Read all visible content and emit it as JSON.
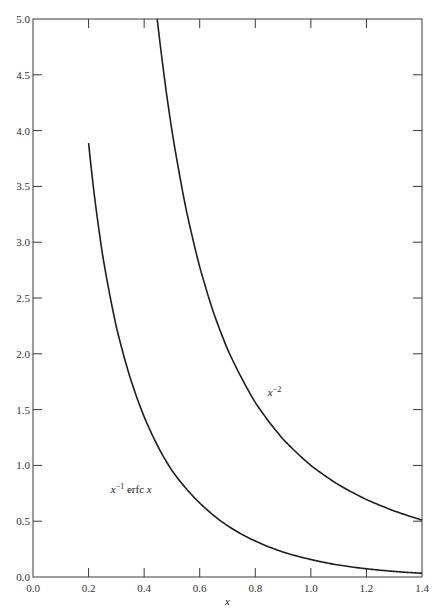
{
  "chart_data": {
    "type": "line",
    "title": "",
    "xlabel": "x",
    "ylabel": "",
    "xlim": [
      0.0,
      1.4
    ],
    "ylim": [
      0.0,
      5.0
    ],
    "grid": false,
    "legend": "none (curves labeled inline)",
    "x_ticks": [
      "0.0",
      "0.2",
      "0.4",
      "0.6",
      "0.8",
      "1.0",
      "1.2",
      "1.4"
    ],
    "y_ticks": [
      "0.0",
      "0.5",
      "1.0",
      "1.5",
      "2.0",
      "2.5",
      "3.0",
      "3.5",
      "4.0",
      "4.5",
      "5.0"
    ],
    "x_tick_values": [
      0.0,
      0.2,
      0.4,
      0.6,
      0.8,
      1.0,
      1.2,
      1.4
    ],
    "y_tick_values": [
      0.0,
      0.5,
      1.0,
      1.5,
      2.0,
      2.5,
      3.0,
      3.5,
      4.0,
      4.5,
      5.0
    ],
    "series": [
      {
        "name": "x^-1 erfc x",
        "label_main": "x",
        "label_sup": "−1",
        "label_rest": " erfc ",
        "label_var": "x",
        "label_anchor": {
          "x": 0.28,
          "y": 0.75
        },
        "x": [
          0.2,
          0.22,
          0.25,
          0.3,
          0.35,
          0.4,
          0.45,
          0.5,
          0.6,
          0.7,
          0.8,
          0.9,
          1.0,
          1.1,
          1.2,
          1.3,
          1.4
        ],
        "y": [
          3.889,
          3.436,
          2.891,
          2.24,
          1.783,
          1.436,
          1.168,
          0.954,
          0.663,
          0.46,
          0.322,
          0.224,
          0.157,
          0.107,
          0.074,
          0.05,
          0.034
        ]
      },
      {
        "name": "x^-2",
        "label_main": "x",
        "label_sup": "−2",
        "label_anchor": {
          "x": 0.845,
          "y": 1.62
        },
        "x": [
          0.447,
          0.46,
          0.48,
          0.5,
          0.55,
          0.6,
          0.65,
          0.7,
          0.8,
          0.9,
          1.0,
          1.1,
          1.2,
          1.3,
          1.4
        ],
        "y": [
          5.0,
          4.726,
          4.34,
          4.0,
          3.306,
          2.778,
          2.367,
          2.041,
          1.563,
          1.235,
          1.0,
          0.826,
          0.694,
          0.592,
          0.51
        ]
      }
    ]
  }
}
